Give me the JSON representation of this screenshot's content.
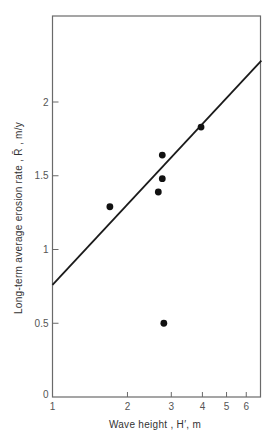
{
  "chart_data": {
    "type": "scatter",
    "title": "",
    "xlabel": "Wave height , H′, m",
    "ylabel": "Long-term average erosion rate , R̄ , m/y",
    "xscale": "log",
    "yscale": "linear",
    "xlim": [
      1,
      6.9
    ],
    "ylim": [
      0,
      2.58
    ],
    "grid": false,
    "legend": null,
    "x_ticks": [
      1,
      2,
      3,
      4,
      5,
      6
    ],
    "x_tick_labels": [
      "1",
      "2",
      "3",
      "4",
      "5",
      "6"
    ],
    "y_ticks": [
      0,
      0.5,
      1,
      1.5,
      2
    ],
    "y_tick_labels": [
      "0",
      "0.5",
      "1",
      "1.5",
      "2"
    ],
    "series": [
      {
        "name": "Observed data",
        "kind": "scatter",
        "x": [
          1.7,
          2.66,
          2.76,
          2.76,
          2.8,
          3.95
        ],
        "y": [
          1.29,
          1.39,
          1.48,
          1.64,
          0.5,
          1.83
        ]
      },
      {
        "name": "Fitted line",
        "kind": "line",
        "x": [
          1,
          6.9
        ],
        "y": [
          0.76,
          2.28
        ]
      }
    ]
  },
  "layout": {
    "plot_left": 52.5,
    "plot_right": 260.5,
    "plot_top": 16,
    "plot_bottom": 397,
    "x_decade_px": 249,
    "y_px_per_unit": 147.5
  }
}
